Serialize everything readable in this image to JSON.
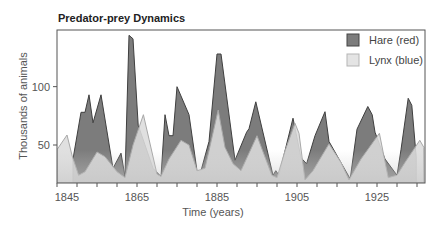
{
  "chart_data": {
    "type": "area",
    "title": "Predator-prey Dynamics",
    "xlabel": "Time (years)",
    "ylabel": "Thousands of animals",
    "xlim": [
      1845,
      1937
    ],
    "ylim": [
      17,
      148
    ],
    "xticks": [
      1845,
      1865,
      1885,
      1905,
      1925
    ],
    "yticks": [
      50,
      100
    ],
    "grid": false,
    "legend_position": "upper right",
    "series": [
      {
        "name": "Hare (red)",
        "fill": "#7c7c7c",
        "stroke": "#3f3f3f",
        "points": [
          [
            1849,
            38
          ],
          [
            1851,
            78
          ],
          [
            1852,
            78
          ],
          [
            1853,
            93
          ],
          [
            1854,
            69
          ],
          [
            1856,
            93
          ],
          [
            1859,
            30
          ],
          [
            1861,
            43
          ],
          [
            1862,
            23
          ],
          [
            1863,
            144
          ],
          [
            1864,
            141
          ],
          [
            1865.3,
            67
          ],
          [
            1867,
            50
          ],
          [
            1869,
            30
          ],
          [
            1871,
            23
          ],
          [
            1872,
            76
          ],
          [
            1873,
            58
          ],
          [
            1874,
            58
          ],
          [
            1875,
            100
          ],
          [
            1878,
            76
          ],
          [
            1880,
            28
          ],
          [
            1881,
            28
          ],
          [
            1883,
            53
          ],
          [
            1885,
            128
          ],
          [
            1886,
            128
          ],
          [
            1889.5,
            37
          ],
          [
            1892.4,
            61
          ],
          [
            1893,
            64
          ],
          [
            1894.7,
            87
          ],
          [
            1899,
            24
          ],
          [
            1899.7,
            28
          ],
          [
            1900.5,
            24
          ],
          [
            1904,
            73
          ],
          [
            1906,
            39
          ],
          [
            1907.4,
            34
          ],
          [
            1909.5,
            58
          ],
          [
            1912,
            78.5
          ],
          [
            1913,
            53
          ],
          [
            1918.3,
            21
          ],
          [
            1920,
            63.5
          ],
          [
            1922.7,
            83
          ],
          [
            1923.8,
            76
          ],
          [
            1924.5,
            61
          ],
          [
            1927,
            38
          ],
          [
            1930,
            24
          ],
          [
            1931,
            46
          ],
          [
            1932.8,
            90
          ],
          [
            1933.7,
            84
          ],
          [
            1934.8,
            40
          ]
        ]
      },
      {
        "name": "Lynx (blue)",
        "fill": "#dcdcdc",
        "stroke": "#a8a8a8",
        "points": [
          [
            1845,
            46
          ],
          [
            1847.5,
            58.6
          ],
          [
            1848.8,
            40.6
          ],
          [
            1850.4,
            24
          ],
          [
            1852,
            27
          ],
          [
            1855,
            44
          ],
          [
            1857,
            40
          ],
          [
            1860,
            27
          ],
          [
            1862,
            22
          ],
          [
            1864,
            50
          ],
          [
            1866.6,
            76
          ],
          [
            1868,
            55
          ],
          [
            1870,
            25
          ],
          [
            1871,
            23
          ],
          [
            1873,
            38
          ],
          [
            1876,
            54
          ],
          [
            1878,
            50
          ],
          [
            1880,
            28
          ],
          [
            1882,
            30
          ],
          [
            1885.3,
            80
          ],
          [
            1887,
            48
          ],
          [
            1889,
            34
          ],
          [
            1891,
            28
          ],
          [
            1895,
            58
          ],
          [
            1898.7,
            24
          ],
          [
            1900,
            22
          ],
          [
            1902,
            45
          ],
          [
            1904.5,
            68.6
          ],
          [
            1905.5,
            60
          ],
          [
            1907,
            20
          ],
          [
            1909,
            28
          ],
          [
            1913,
            51
          ],
          [
            1916,
            35
          ],
          [
            1918,
            20
          ],
          [
            1921,
            38
          ],
          [
            1925.6,
            60
          ],
          [
            1927.8,
            22
          ],
          [
            1930,
            24
          ],
          [
            1932,
            35
          ],
          [
            1935.7,
            54
          ],
          [
            1936.7,
            48
          ]
        ]
      }
    ]
  },
  "legend": {
    "items": [
      {
        "label": "Hare (red)",
        "swatch": "#7c7c7c"
      },
      {
        "label": "Lynx (blue)",
        "swatch": "#e4e4e4"
      }
    ]
  }
}
